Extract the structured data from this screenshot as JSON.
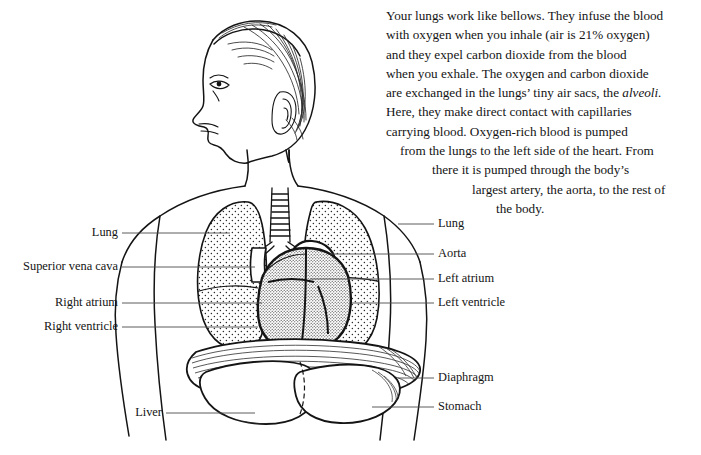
{
  "figure": {
    "view": "upper torso with head in left profile, frontal chest cutaway",
    "style": "black-and-white pen-and-ink line drawing with stipple shading",
    "ink_color": "#141414",
    "background_color": "#ffffff"
  },
  "body_text": {
    "lines": [
      {
        "text": "Your lungs work like bellows. They infuse the blood",
        "align": "c1"
      },
      {
        "text": "with oxygen when you inhale (air is 21% oxygen)",
        "align": "c1"
      },
      {
        "text": "and they expel carbon dioxide from the blood",
        "align": "c1"
      },
      {
        "text": "when you exhale. The oxygen and carbon dioxide",
        "align": "c1"
      },
      {
        "text": "are exchanged in the lungs’ tiny air sacs, the ",
        "italic": "alveoli.",
        "align": "c1"
      },
      {
        "text": "Here, they make direct contact with capillaries",
        "align": "c1"
      },
      {
        "text": "carrying blood. Oxygen-rich blood is pumped",
        "align": "c1"
      },
      {
        "text": "from the lungs to the left side of the heart. From",
        "align": "c2"
      },
      {
        "text": "there it is pumped through the body’s",
        "align": "c3"
      },
      {
        "text": "largest artery, the aorta, to the rest of",
        "align": "c4"
      },
      {
        "text": "the body.",
        "align": "c5"
      }
    ],
    "plain": "Your lungs work like bellows. They infuse the blood with oxygen when you inhale (air is 21% oxygen) and they expel carbon dioxide from the blood when you exhale. The oxygen and carbon dioxide are exchanged in the lungs’ tiny air sacs, the alveoli. Here, they make direct contact with capillaries carrying blood. Oxygen-rich blood is pumped from the lungs to the left side of the heart. From there it is pumped through the body’s largest artery, the aorta, to the rest of the body."
  },
  "labels_left": [
    {
      "id": "lung-left-label",
      "text": "Lung",
      "x": 118,
      "y": 233,
      "line_x1": 122,
      "line_x2": 230,
      "line_y": 233
    },
    {
      "id": "superior-vena-cava-label",
      "text": "Superior vena cava",
      "x": 118,
      "y": 267,
      "line_x1": 122,
      "line_x2": 255,
      "line_y": 267
    },
    {
      "id": "right-atrium-label",
      "text": "Right atrium",
      "x": 118,
      "y": 303,
      "line_x1": 122,
      "line_x2": 262,
      "line_y": 303
    },
    {
      "id": "right-ventricle-label",
      "text": "Right ventricle",
      "x": 118,
      "y": 327,
      "line_x1": 122,
      "line_x2": 258,
      "line_y": 327
    },
    {
      "id": "liver-label",
      "text": "Liver",
      "x": 162,
      "y": 413,
      "line_x1": 166,
      "line_x2": 255,
      "line_y": 413
    }
  ],
  "labels_right": [
    {
      "id": "lung-right-label",
      "text": "Lung",
      "x": 438,
      "y": 224,
      "line_x1": 398,
      "line_x2": 434,
      "line_y": 224
    },
    {
      "id": "aorta-label",
      "text": "Aorta",
      "x": 438,
      "y": 254,
      "line_x1": 330,
      "line_x2": 434,
      "line_y": 254
    },
    {
      "id": "left-atrium-label",
      "text": "Left atrium",
      "x": 438,
      "y": 279,
      "line_x1": 310,
      "line_x2": 434,
      "line_y": 279
    },
    {
      "id": "left-ventricle-label",
      "text": "Left ventricle",
      "x": 438,
      "y": 303,
      "line_x1": 352,
      "line_x2": 434,
      "line_y": 303
    },
    {
      "id": "diaphragm-label",
      "text": "Diaphragm",
      "x": 438,
      "y": 378,
      "line_x1": 398,
      "line_x2": 434,
      "line_y": 378
    },
    {
      "id": "stomach-label",
      "text": "Stomach",
      "x": 438,
      "y": 407,
      "line_x1": 372,
      "line_x2": 434,
      "line_y": 407
    }
  ],
  "anatomy_parts": [
    "head-profile",
    "hair",
    "ear",
    "eye",
    "nose",
    "mouth",
    "chin",
    "neck",
    "shoulders",
    "torso-outline",
    "arms",
    "trachea",
    "left-lung",
    "right-lung",
    "heart",
    "aortic-arch",
    "superior-vena-cava",
    "diaphragm",
    "liver",
    "stomach"
  ]
}
